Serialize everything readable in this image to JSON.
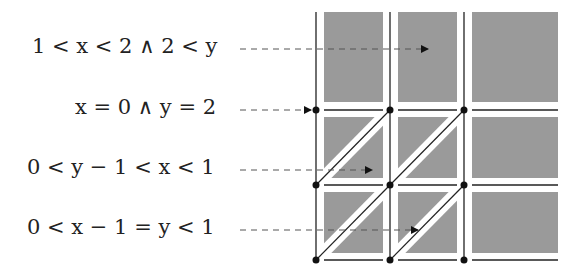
{
  "labels": [
    {
      "id": "region-top",
      "text": "1 < x < 2 ∧ 2 < y",
      "y": 49,
      "arrow_end_x": 428
    },
    {
      "id": "point-x0-y2",
      "text": "x = 0 ∧ y = 2",
      "y": 110,
      "arrow_end_x": 312
    },
    {
      "id": "region-upper-triangle",
      "text": "0 < y − 1 < x < 1",
      "y": 170,
      "arrow_end_x": 372
    },
    {
      "id": "region-diagonal",
      "text": "0 < x − 1 = y < 1",
      "y": 230,
      "arrow_end_x": 418
    }
  ],
  "grid": {
    "vertical_lines_x": [
      316,
      390,
      464
    ],
    "horizontal_lines_y": [
      110,
      185,
      260
    ],
    "top_y": 12,
    "right_x": 558,
    "cell_fill": "#9a9a9a",
    "line_color": "#222222",
    "diagonal_cells": [
      [
        0,
        1
      ],
      [
        1,
        1
      ],
      [
        0,
        2
      ],
      [
        1,
        2
      ]
    ]
  }
}
